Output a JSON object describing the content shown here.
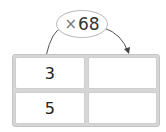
{
  "operator": {
    "symbol": "×",
    "value": "68"
  },
  "table": {
    "rows": [
      {
        "left": "3",
        "right": ""
      },
      {
        "left": "5",
        "right": ""
      }
    ]
  },
  "colors": {
    "border": "#bdbdbd",
    "table_bg": "#d6d6d6",
    "cell_bg": "#ffffff"
  }
}
